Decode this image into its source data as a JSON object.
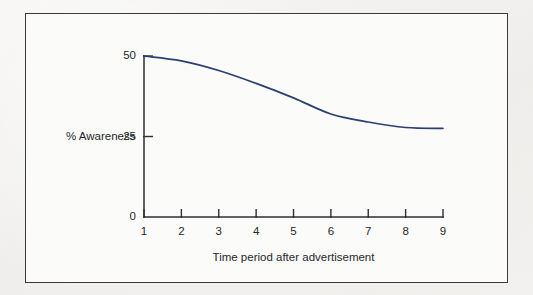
{
  "chart_data": {
    "type": "line",
    "title": "",
    "subtitle": "",
    "xlabel": "Time period after advertisement",
    "ylabel": "% Awareness",
    "x": [
      1,
      2,
      3,
      4,
      5,
      6,
      7,
      8,
      9
    ],
    "series": [
      {
        "name": "% Awareness",
        "values": [
          50,
          48.5,
          45.5,
          41.5,
          37,
          32,
          29.5,
          27.8,
          27.5
        ],
        "color": "#2b3f73"
      }
    ],
    "xlim": [
      1,
      9
    ],
    "ylim": [
      0,
      50
    ],
    "x_tick_labels": [
      "1",
      "2",
      "3",
      "4",
      "5",
      "6",
      "7",
      "8",
      "9"
    ],
    "y_tick_labels": [
      "0",
      "25",
      "50"
    ],
    "y_tick_values": [
      0,
      25,
      50
    ],
    "grid": false,
    "legend": false,
    "legend_position": "none",
    "axis_color": "#2f2f35",
    "frame_color": "#3a3a3e",
    "background_color": "#fbfbfa"
  },
  "figure": {
    "border_color": "#3a3a3e",
    "page_background": "#f3f2f0"
  }
}
